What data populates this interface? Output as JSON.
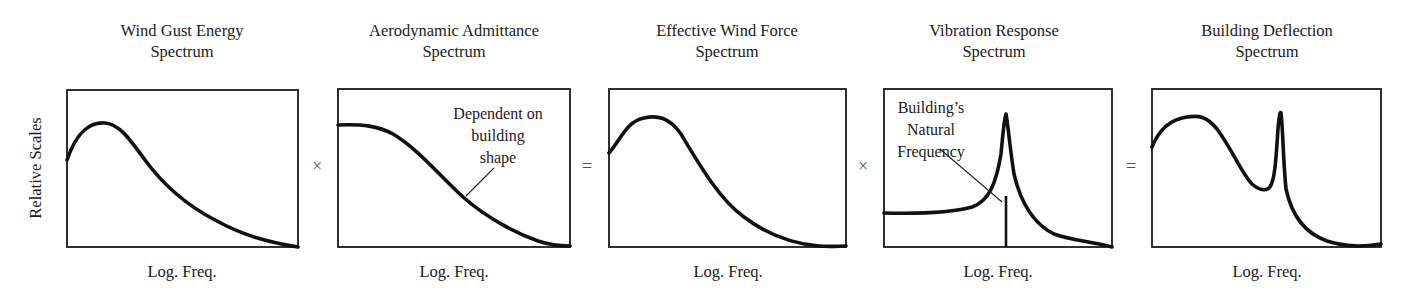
{
  "diagram": {
    "y_axis_label": "Relative Scales",
    "panels": [
      {
        "title_line1": "Wind Gust Energy",
        "title_line2": "Spectrum",
        "xlabel": "Log. Freq."
      },
      {
        "title_line1": "Aerodynamic Admittance",
        "title_line2": "Spectrum",
        "xlabel": "Log. Freq.",
        "annotation": [
          "Dependent on",
          "building",
          "shape"
        ]
      },
      {
        "title_line1": "Effective Wind Force",
        "title_line2": "Spectrum",
        "xlabel": "Log. Freq."
      },
      {
        "title_line1": "Vibration Response",
        "title_line2": "Spectrum",
        "xlabel": "Log. Freq.",
        "annotation": [
          "Building’s",
          "Natural",
          "Frequency"
        ]
      },
      {
        "title_line1": "Building Deflection",
        "title_line2": "Spectrum",
        "xlabel": "Log. Freq."
      }
    ],
    "operators": [
      "×",
      "=",
      "×",
      "="
    ]
  }
}
